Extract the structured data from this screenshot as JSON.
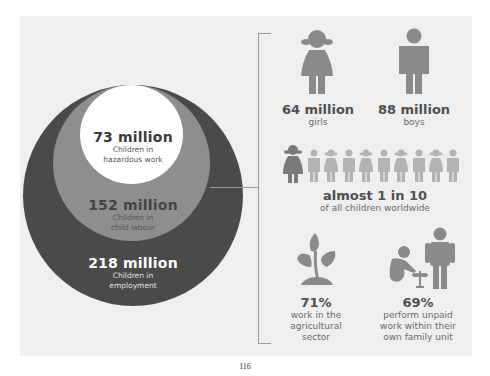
{
  "circles": {
    "inner": {
      "value": "73 million",
      "label_line1": "Children in",
      "label_line2": "hazardous work",
      "color": "#ffffff"
    },
    "middle": {
      "value": "152 million",
      "label_line1": "Children in",
      "label_line2": "child labour",
      "color": "#8e8e8e"
    },
    "outer": {
      "value": "218 million",
      "label_line1": "Children in",
      "label_line2": "employment",
      "color": "#4a4a4a"
    }
  },
  "gender": {
    "girls": {
      "value": "64 million",
      "label": "girls",
      "icon": "girl-icon"
    },
    "boys": {
      "value": "88 million",
      "label": "boys",
      "icon": "boy-icon"
    }
  },
  "ratio": {
    "value": "almost 1 in 10",
    "label": "of all children worldwide",
    "icons": [
      "girl-dark",
      "boy",
      "girl",
      "boy",
      "girl",
      "boy",
      "girl",
      "boy",
      "girl",
      "boy"
    ]
  },
  "agriculture": {
    "value": "71%",
    "line1": "work in the",
    "line2": "agricultural",
    "line3": "sector",
    "icon": "plant-icon"
  },
  "family": {
    "value": "69%",
    "line1": "perform unpaid",
    "line2": "work within their",
    "line3": "own family unit",
    "icon": "child-adult-icon"
  },
  "page_number": "116"
}
